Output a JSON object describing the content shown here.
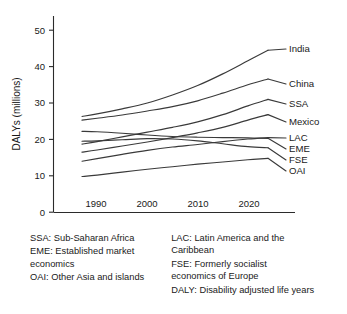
{
  "chart_data": {
    "type": "line",
    "title": "",
    "xlabel": "",
    "ylabel": "DALYs (millions)",
    "xlim": [
      1987,
      2024
    ],
    "ylim": [
      0,
      55
    ],
    "xticks": [
      1990,
      2000,
      2010,
      2020
    ],
    "yticks": [
      0,
      10,
      20,
      30,
      40,
      50
    ],
    "grid": false,
    "legend_position": "right-of-axes-inline",
    "x": [
      1987,
      1990,
      1995,
      2000,
      2005,
      2010,
      2015,
      2020,
      2024
    ],
    "series": [
      {
        "name": "India",
        "label": "India",
        "values": [
          26.3,
          27.0,
          28.4,
          30.0,
          32.2,
          34.8,
          38.0,
          41.6,
          44.5
        ]
      },
      {
        "name": "China",
        "label": "China",
        "values": [
          25.3,
          25.8,
          26.7,
          27.8,
          29.0,
          30.6,
          32.7,
          35.0,
          36.6
        ]
      },
      {
        "name": "SSA",
        "label": "SSA",
        "values": [
          18.7,
          19.4,
          20.7,
          22.0,
          23.3,
          24.8,
          26.8,
          29.2,
          31.0
        ]
      },
      {
        "name": "Mexico",
        "label": "Mexico",
        "values": [
          16.5,
          17.1,
          18.2,
          19.3,
          20.5,
          21.8,
          23.3,
          25.3,
          26.8
        ]
      },
      {
        "name": "LAC",
        "label": "LAC",
        "values": [
          14.0,
          14.7,
          15.9,
          17.0,
          17.9,
          18.6,
          19.4,
          20.1,
          20.5
        ]
      },
      {
        "name": "EME",
        "label": "EME",
        "values": [
          22.2,
          22.1,
          21.7,
          21.2,
          20.8,
          20.6,
          20.5,
          20.4,
          20.3
        ]
      },
      {
        "name": "FSE",
        "label": "FSE",
        "values": [
          19.5,
          19.6,
          19.9,
          20.2,
          20.1,
          19.6,
          18.8,
          18.0,
          17.7
        ]
      },
      {
        "name": "OAI",
        "label": "OAI",
        "values": [
          9.8,
          10.2,
          11.0,
          11.8,
          12.5,
          13.2,
          13.8,
          14.4,
          14.8
        ]
      }
    ]
  },
  "axes": {
    "ylabel": "DALYs (millions)",
    "ytick_labels": [
      "50",
      "40",
      "30",
      "20",
      "10",
      "0"
    ],
    "xtick_labels": [
      "1990",
      "2000",
      "2010",
      "2020"
    ]
  },
  "series_labels": {
    "india": "India",
    "china": "China",
    "ssa": "SSA",
    "mexico": "Mexico",
    "lac": "LAC",
    "eme": "EME",
    "fse": "FSE",
    "oai": "OAI"
  },
  "legend": {
    "left_column": [
      "SSA: Sub-Saharan Africa",
      "EME: Established market\n          economics",
      "OAI: Other Asia and islands"
    ],
    "right_column": [
      "LAC: Latin America and the\n          Caribbean",
      "FSE: Formerly socialist\n          economics of Europe",
      "DALY: Disability adjusted life years"
    ]
  },
  "colors": {
    "line": "#3a3a3a",
    "axis": "#2b2b2b",
    "text": "#1a1a1a",
    "background": "#ffffff"
  }
}
